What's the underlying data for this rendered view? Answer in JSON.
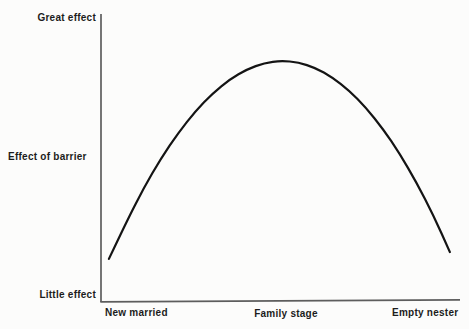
{
  "figure": {
    "background": "#fcfcfb",
    "axis_color": "#4a4a4a",
    "text_color": "#1c1c1c"
  },
  "chart_data": {
    "type": "line",
    "title": "",
    "ylabel": "Effect of barrier",
    "y_axis_labels": {
      "top": "Great effect",
      "bottom": "Little effect"
    },
    "categories": [
      "New married",
      "Family stage",
      "Empty nester"
    ],
    "grid": false,
    "legend": false,
    "line_color": "#141414",
    "line_width": 2.2,
    "x_range_norm": [
      0,
      1
    ],
    "y_range_norm": [
      0,
      1
    ],
    "series": [
      {
        "name": "effect-of-barrier-curve",
        "points_norm": [
          [
            0.022,
            0.15
          ],
          [
            0.071,
            0.28
          ],
          [
            0.119,
            0.397
          ],
          [
            0.167,
            0.5
          ],
          [
            0.215,
            0.589
          ],
          [
            0.263,
            0.665
          ],
          [
            0.311,
            0.727
          ],
          [
            0.359,
            0.776
          ],
          [
            0.407,
            0.811
          ],
          [
            0.455,
            0.833
          ],
          [
            0.502,
            0.841
          ],
          [
            0.55,
            0.835
          ],
          [
            0.597,
            0.816
          ],
          [
            0.644,
            0.783
          ],
          [
            0.691,
            0.737
          ],
          [
            0.738,
            0.677
          ],
          [
            0.785,
            0.604
          ],
          [
            0.832,
            0.517
          ],
          [
            0.879,
            0.416
          ],
          [
            0.926,
            0.302
          ],
          [
            0.972,
            0.174
          ]
        ]
      }
    ]
  }
}
